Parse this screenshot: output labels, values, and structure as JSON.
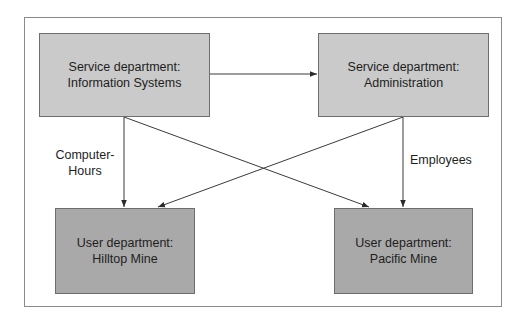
{
  "diagram": {
    "nodes": [
      {
        "id": "is",
        "line1": "Service department:",
        "line2": "Information Systems",
        "kind": "service"
      },
      {
        "id": "admin",
        "line1": "Service department:",
        "line2": "Administration",
        "kind": "service"
      },
      {
        "id": "hilltop",
        "line1": "User department:",
        "line2": "Hilltop Mine",
        "kind": "user"
      },
      {
        "id": "pacific",
        "line1": "User department:",
        "line2": "Pacific Mine",
        "kind": "user"
      }
    ],
    "edges": [
      {
        "from": "is",
        "to": "admin"
      },
      {
        "from": "is",
        "to": "hilltop"
      },
      {
        "from": "is",
        "to": "pacific"
      },
      {
        "from": "admin",
        "to": "hilltop"
      },
      {
        "from": "admin",
        "to": "pacific"
      }
    ],
    "labels": {
      "computer_hours_line1": "Computer-",
      "computer_hours_line2": "Hours",
      "employees": "Employees"
    },
    "colors": {
      "service_fill": "#cacaca",
      "user_fill": "#a9a9a9",
      "line": "#3a3a3a"
    }
  }
}
